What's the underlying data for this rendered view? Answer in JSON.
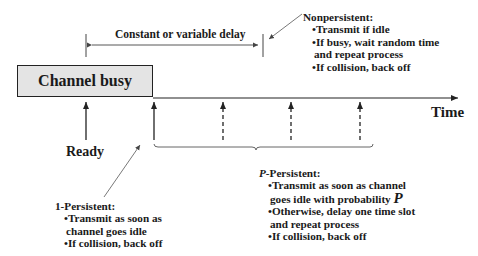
{
  "diagram": {
    "channel_busy_label": "Channel busy",
    "time_label": "Time",
    "ready_label": "Ready",
    "delay_label": "Constant or variable delay",
    "nonpersistent": {
      "heading": "Nonpersistent:",
      "items": [
        "•Transmit if idle",
        "•If busy, wait random time",
        "and repeat process",
        "•If collision, back off"
      ]
    },
    "one_persistent": {
      "heading": "1-Persistent:",
      "items": [
        "•Transmit as soon as",
        "channel goes idle",
        "•If collision, back off"
      ]
    },
    "p_persistent": {
      "heading_italic": "P",
      "heading_rest": "-Persistent:",
      "items": [
        "•Transmit as soon as channel",
        "goes idle with probability ",
        "•Otherwise, delay one time slot",
        "and repeat process",
        "•If collision, back off"
      ],
      "probability_symbol": "P"
    },
    "colors": {
      "busy_fill": "#e4e4e4",
      "line": "#222222",
      "leader_line": "#555555"
    }
  }
}
